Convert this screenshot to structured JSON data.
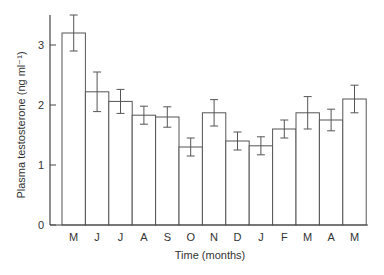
{
  "chart_data": {
    "type": "bar",
    "title": "",
    "xlabel": "Time (months)",
    "ylabel": "Plasma testosterone (ng ml⁻¹)",
    "ylim": [
      0,
      3.5
    ],
    "yticks": [
      0,
      1,
      2,
      3
    ],
    "categories": [
      "M",
      "J",
      "J",
      "A",
      "S",
      "O",
      "N",
      "D",
      "J",
      "F",
      "M",
      "A",
      "M"
    ],
    "values": [
      3.2,
      2.22,
      2.06,
      1.83,
      1.8,
      1.3,
      1.87,
      1.4,
      1.32,
      1.6,
      1.87,
      1.75,
      2.1
    ],
    "errors": [
      0.3,
      0.33,
      0.2,
      0.15,
      0.17,
      0.15,
      0.22,
      0.15,
      0.15,
      0.15,
      0.27,
      0.18,
      0.23
    ],
    "grid": false,
    "legend": null
  },
  "style": {
    "bar_fill": "#ffffff",
    "bar_stroke": "#555555",
    "axis_color": "#444444"
  }
}
